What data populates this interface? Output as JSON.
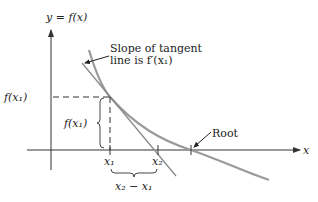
{
  "diagram": {
    "axis_y_label": "y = f(x)",
    "axis_x_label": "x",
    "point_label_y": "f(x₁)",
    "brace_vertical_label": "f(x₁)",
    "tick_x1_label": "x₁",
    "tick_x2_label": "x₂",
    "brace_horizontal_label": "x₂ − x₁",
    "annotation_tangent_line1": "Slope of tangent",
    "annotation_tangent_line2": "line is f′(x₁)",
    "annotation_root": "Root",
    "colors": {
      "curve": "#9a9a9a",
      "tangent": "#8a8a8a",
      "axes": "#333333",
      "text": "#222222"
    }
  }
}
